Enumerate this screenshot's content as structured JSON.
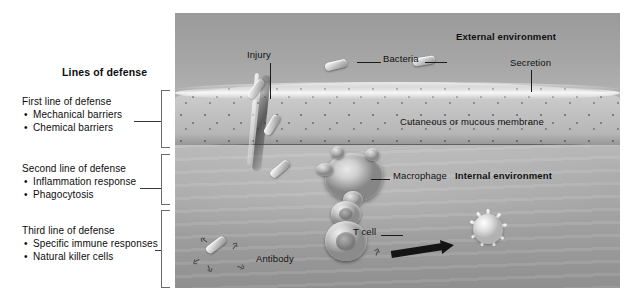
{
  "figure": {
    "panel_heading": "Lines of defense",
    "groups": [
      {
        "title": "First line of defense",
        "items": [
          "Mechanical barriers",
          "Chemical barriers"
        ]
      },
      {
        "title": "Second line of defense",
        "items": [
          "Inflammation response",
          "Phagocytosis"
        ]
      },
      {
        "title": "Third line of defense",
        "items": [
          "Specific immune responses",
          "Natural killer cells"
        ]
      }
    ]
  },
  "artwork": {
    "labels": {
      "injury": "Injury",
      "bacteria": "Bacteria",
      "external_environment": "External environment",
      "secretion": "Secretion",
      "membrane": "Cutaneous or mucous membrane",
      "macrophage": "Macrophage",
      "internal_environment": "Internal environment",
      "t_cell": "T cell",
      "antibody": "Antibody"
    },
    "icons": {
      "bacterium": "bacterium-rod-icon",
      "macrophage": "macrophage-cell-icon",
      "t_cell": "t-cell-icon",
      "natural_killer": "natural-killer-cell-icon",
      "antibody": "antibody-y-icon",
      "arrow": "process-arrow-icon",
      "wound": "injury-wound-icon"
    }
  },
  "colors": {
    "page_background": "#ffffff",
    "text": "#0d0d0d",
    "bracket": "#6a6a6a",
    "leader": "#3a3a3a",
    "artwork_mid": "#a3a3a3",
    "arrow": "#141414"
  }
}
